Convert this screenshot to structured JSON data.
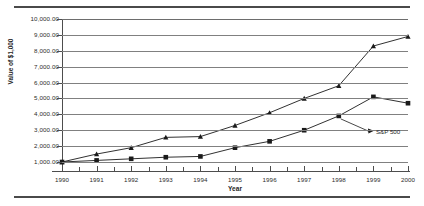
{
  "chart_data": {
    "type": "line",
    "title": "",
    "xlabel": "Year",
    "ylabel": "Value of $1,000",
    "x": [
      1990,
      1991,
      1992,
      1993,
      1994,
      1995,
      1996,
      1997,
      1998,
      1999,
      2000
    ],
    "xtick_labels": [
      "1990",
      "1991",
      "1992",
      "1993",
      "1994",
      "1995",
      "1996",
      "1997",
      "1998",
      "1999",
      "2000"
    ],
    "ytick_labels": [
      "1,000.00",
      "2,000.00",
      "3,000.00",
      "4,000.00",
      "5,000.00",
      "6,000.00",
      "7,000.00",
      "8,000.00",
      "9,000.00",
      "10,000.00"
    ],
    "ytick_values": [
      1000,
      2000,
      3000,
      4000,
      5000,
      6000,
      7000,
      8000,
      9000,
      10000
    ],
    "ylim": [
      1000,
      10000
    ],
    "xlim": [
      1990,
      2000
    ],
    "grid": true,
    "legend": "none",
    "series": [
      {
        "name": "upper-portfolio",
        "marker": "triangle",
        "color": "#1a1a1a",
        "values": [
          1000,
          1500,
          1900,
          2550,
          2600,
          3300,
          4100,
          5000,
          5800,
          8300,
          8900
        ]
      },
      {
        "name": "S&P 500",
        "marker": "square",
        "color": "#1a1a1a",
        "values": [
          1000,
          1100,
          1200,
          1300,
          1350,
          1900,
          2300,
          3000,
          3900,
          5100,
          4700
        ]
      }
    ],
    "annotations": [
      {
        "text": "S&P 500",
        "points_to_year": 1998,
        "points_to_value": 3900
      }
    ]
  }
}
